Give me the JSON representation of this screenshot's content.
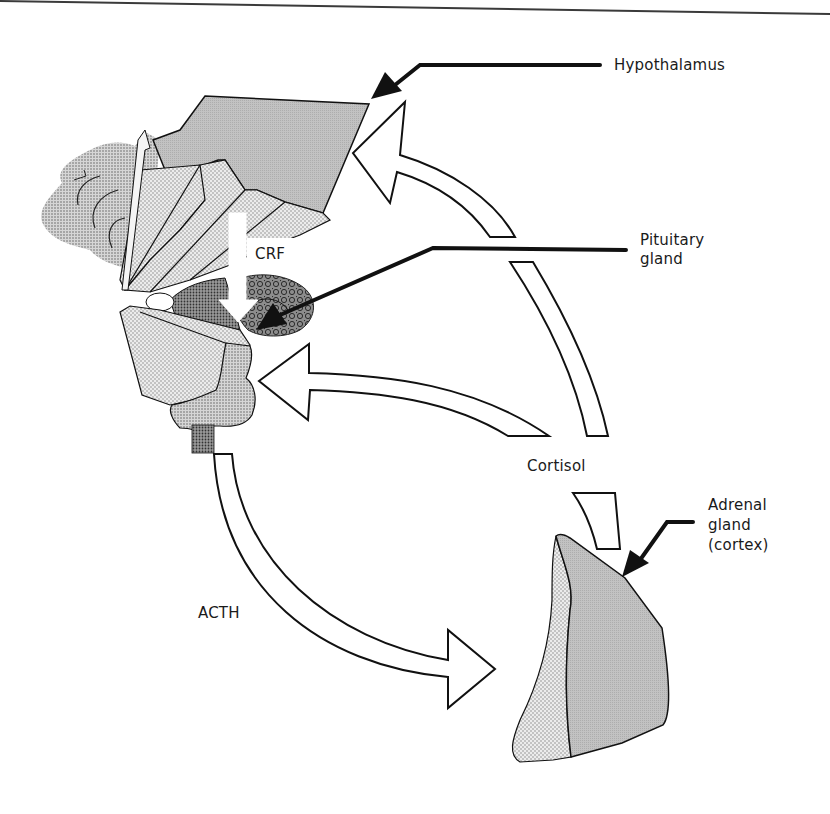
{
  "diagram": {
    "type": "HPA axis feedback loop",
    "colors": {
      "outline": "#111111",
      "hypothalamus_fill": "#bdbdbd",
      "stipple_light": "#dcdcdc",
      "stipple_mid": "#c4c4c4",
      "stipple_dark": "#8a8a8a",
      "adrenal_cortex_fill": "#b8b8b8",
      "adrenal_medulla_fill": "#e2e2e2",
      "arrow_fill": "#ffffff"
    },
    "labels": {
      "hypothalamus": "Hypothalamus",
      "pituitary": "Pituitary\ngland",
      "crf": "CRF",
      "cortisol": "Cortisol",
      "adrenal": "Adrenal\ngland\n(cortex)",
      "acth": "ACTH"
    },
    "nodes": [
      {
        "id": "hypothalamus",
        "label": "Hypothalamus"
      },
      {
        "id": "pituitary",
        "label": "Pituitary gland"
      },
      {
        "id": "adrenal",
        "label": "Adrenal gland (cortex)"
      }
    ],
    "edges": [
      {
        "from": "hypothalamus",
        "to": "pituitary",
        "label": "CRF"
      },
      {
        "from": "pituitary",
        "to": "adrenal",
        "label": "ACTH"
      },
      {
        "from": "adrenal",
        "to": "pituitary",
        "label": "Cortisol",
        "kind": "negative feedback"
      },
      {
        "from": "adrenal",
        "to": "hypothalamus",
        "label": "Cortisol",
        "kind": "negative feedback"
      }
    ]
  }
}
